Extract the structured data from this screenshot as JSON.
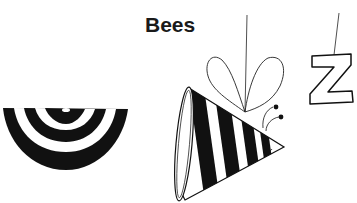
{
  "title": "Bees",
  "illustration": {
    "elements": [
      {
        "name": "striped-semicircle",
        "description": "black-and-white concentric striped half bowl"
      },
      {
        "name": "cone-bee",
        "description": "striped cone-shaped bee with wings and antennae hanging from a string"
      },
      {
        "name": "letter-z",
        "description": "outlined letter Z hanging from a string",
        "letter": "Z"
      }
    ]
  },
  "colors": {
    "ink": "#111111",
    "paper": "#ffffff"
  }
}
